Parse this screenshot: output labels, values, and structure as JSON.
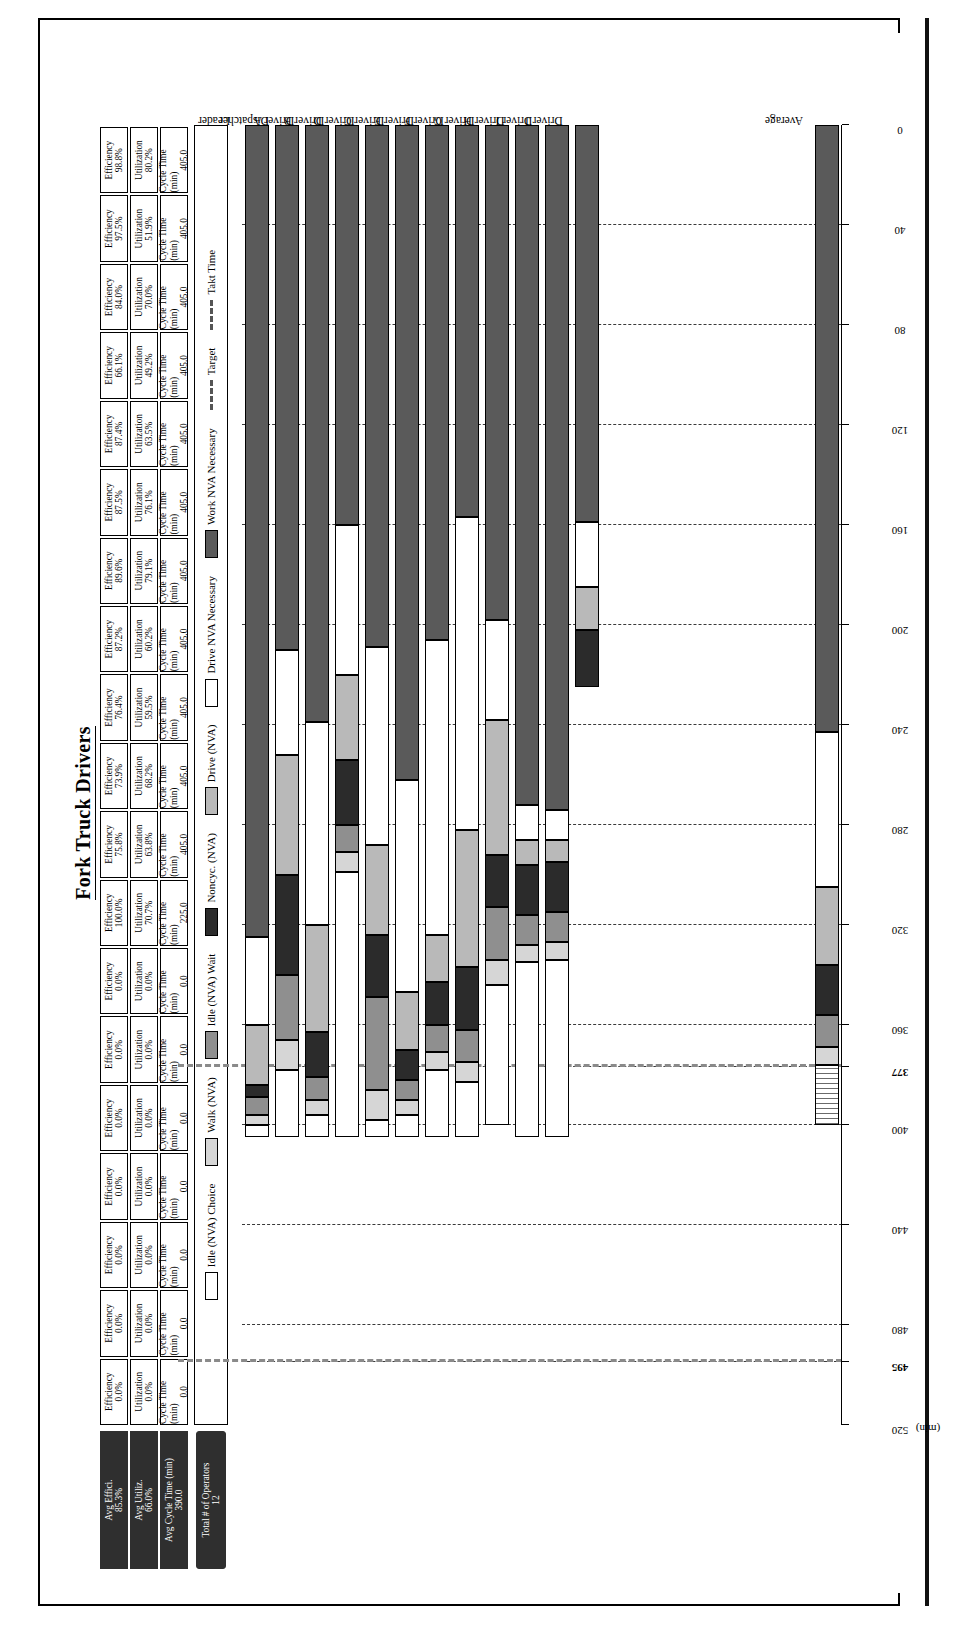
{
  "title": "Fork Truck Drivers",
  "summary": {
    "avg_efficiency_label": "Avg Effici.",
    "avg_efficiency_value": "85.3%",
    "avg_utilization_label": "Avg Utiliz.",
    "avg_utilization_value": "66.0%",
    "avg_cycle_label": "Avg Cycle Time (min)",
    "avg_cycle_value": "390.0",
    "operators_label": "Total # of Operators",
    "operators_value": "12"
  },
  "table": {
    "row_labels": [
      "Efficiency",
      "Utilization",
      "Cycle Time (min)"
    ],
    "columns": [
      {
        "name": "Leader",
        "efficiency": "98.8%",
        "utilization": "80.2%",
        "cycle": "405.0"
      },
      {
        "name": "Dispatcher",
        "efficiency": "97.5%",
        "utilization": "51.9%",
        "cycle": "405.0"
      },
      {
        "name": "Driver A",
        "efficiency": "84.0%",
        "utilization": "70.0%",
        "cycle": "405.0"
      },
      {
        "name": "Driver B",
        "efficiency": "66.1%",
        "utilization": "49.2%",
        "cycle": "405.0"
      },
      {
        "name": "Driver D",
        "efficiency": "87.4%",
        "utilization": "63.5%",
        "cycle": "405.0"
      },
      {
        "name": "Driver C",
        "efficiency": "87.5%",
        "utilization": "76.1%",
        "cycle": "405.0"
      },
      {
        "name": "Driver E",
        "efficiency": "89.6%",
        "utilization": "79.1%",
        "cycle": "405.0"
      },
      {
        "name": "Driver F",
        "efficiency": "87.2%",
        "utilization": "60.2%",
        "cycle": "405.0"
      },
      {
        "name": "Driver G",
        "efficiency": "76.4%",
        "utilization": "59.5%",
        "cycle": "405.0"
      },
      {
        "name": "Driver H",
        "efficiency": "73.9%",
        "utilization": "68.2%",
        "cycle": "405.0"
      },
      {
        "name": "Driver I",
        "efficiency": "75.8%",
        "utilization": "63.8%",
        "cycle": "405.0"
      },
      {
        "name": "Driver J",
        "efficiency": "100.0%",
        "utilization": "70.7%",
        "cycle": "225.0"
      },
      {
        "name": "",
        "efficiency": "0.0%",
        "utilization": "0.0%",
        "cycle": "0.0"
      },
      {
        "name": "",
        "efficiency": "0.0%",
        "utilization": "0.0%",
        "cycle": "0.0"
      },
      {
        "name": "",
        "efficiency": "0.0%",
        "utilization": "0.0%",
        "cycle": "0.0"
      },
      {
        "name": "",
        "efficiency": "0.0%",
        "utilization": "0.0%",
        "cycle": "0.0"
      },
      {
        "name": "",
        "efficiency": "0.0%",
        "utilization": "0.0%",
        "cycle": "0.0"
      },
      {
        "name": "",
        "efficiency": "0.0%",
        "utilization": "0.0%",
        "cycle": "0.0"
      },
      {
        "name": "",
        "efficiency": "0.0%",
        "utilization": "0.0%",
        "cycle": "0.0"
      }
    ]
  },
  "legend": {
    "items": [
      {
        "label": "Idle (NVA) Choice",
        "type": "swatch",
        "color": "#ffffff"
      },
      {
        "label": "Walk (NVA)",
        "type": "swatch",
        "color": "#d6d6d6"
      },
      {
        "label": "Idle (NVA) Wait",
        "type": "swatch",
        "color": "#8f8f8f"
      },
      {
        "label": "Noncyc. (NVA)",
        "type": "swatch",
        "color": "#2b2b2b"
      },
      {
        "label": "Drive (NVA)",
        "type": "swatch",
        "color": "#b9b9b9"
      },
      {
        "label": "Drive NVA Necessary",
        "type": "swatch",
        "color": "#ffffff"
      },
      {
        "label": "Work NVA Necessary",
        "type": "swatch",
        "color": "#5a5a5a"
      },
      {
        "label": "Target",
        "type": "line",
        "color": "#8a8a8a"
      },
      {
        "label": "Takt Time",
        "type": "line",
        "color": "#8a8a8a"
      }
    ]
  },
  "chart_data": {
    "type": "bar",
    "orientation": "horizontal-stacked",
    "title": "Fork Truck Drivers",
    "xlabel": "",
    "ylabel": "(min)",
    "ylim": [
      0,
      520
    ],
    "grid": true,
    "legend_position": "top",
    "unit_label": "(min)",
    "tick_labels": [
      "520",
      "495",
      "480",
      "440",
      "400",
      "377",
      "360",
      "320",
      "280",
      "240",
      "200",
      "160",
      "120",
      "80",
      "40",
      "0"
    ],
    "tick_values": [
      520,
      495,
      480,
      440,
      400,
      377,
      360,
      320,
      280,
      240,
      200,
      160,
      120,
      80,
      40,
      0
    ],
    "bold_ticks": [
      "495",
      "377"
    ],
    "reference_lines": [
      {
        "name": "Takt Time",
        "value": 495
      },
      {
        "name": "Target",
        "value": 377
      }
    ],
    "categories": [
      "Leader",
      "Dispatcher",
      "Driver A",
      "Driver B",
      "Driver D",
      "Driver C",
      "Driver E",
      "Driver F",
      "Driver G",
      "Driver H",
      "Driver I",
      "Driver J",
      "",
      "",
      "",
      "",
      "",
      "",
      "",
      "Average"
    ],
    "series": [
      {
        "name": "Work NVA Necessary",
        "color": "#5a5a5a",
        "values": [
          325,
          210,
          239,
          160,
          209,
          262,
          206,
          157,
          198,
          272,
          274,
          159,
          0,
          0,
          0,
          0,
          0,
          0,
          0,
          243
        ]
      },
      {
        "name": "Drive NVA Necessary",
        "color": "#ffffff",
        "values": [
          35,
          42,
          81,
          60,
          79,
          85,
          118,
          125,
          40,
          14,
          12,
          26,
          0,
          0,
          0,
          0,
          0,
          0,
          0,
          62
        ]
      },
      {
        "name": "Drive (NVA)",
        "color": "#b9b9b9",
        "values": [
          24,
          48,
          43,
          34,
          36,
          23,
          19,
          55,
          54,
          10,
          9,
          17,
          0,
          0,
          0,
          0,
          0,
          0,
          0,
          31
        ]
      },
      {
        "name": "Noncyc. (NVA)",
        "color": "#2b2b2b",
        "values": [
          5,
          40,
          18,
          26,
          25,
          12,
          17,
          25,
          21,
          20,
          20,
          23,
          0,
          0,
          0,
          0,
          0,
          0,
          0,
          20
        ]
      },
      {
        "name": "Idle (NVA) Wait",
        "color": "#8f8f8f",
        "values": [
          7,
          26,
          9,
          11,
          37,
          8,
          11,
          13,
          21,
          12,
          12,
          0,
          0,
          0,
          0,
          0,
          0,
          0,
          0,
          13
        ]
      },
      {
        "name": "Walk (NVA)",
        "color": "#d6d6d6",
        "values": [
          4,
          12,
          6,
          8,
          12,
          6,
          7,
          8,
          10,
          7,
          7,
          0,
          0,
          0,
          0,
          0,
          0,
          0,
          0,
          7
        ]
      },
      {
        "name": "Idle (NVA) Choice",
        "color": "#ffffff",
        "values": [
          5,
          27,
          9,
          106,
          7,
          9,
          27,
          22,
          56,
          70,
          71,
          0,
          0,
          0,
          0,
          0,
          0,
          0,
          0,
          24
        ]
      }
    ],
    "average_bar_style": "hatched"
  }
}
